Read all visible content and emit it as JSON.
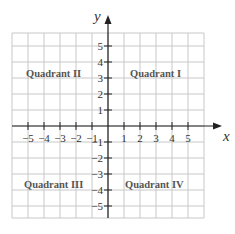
{
  "diagram": {
    "type": "coordinate-plane",
    "axes": {
      "x_label": "x",
      "y_label": "y"
    },
    "x_ticks": [
      "−5",
      "−4",
      "−3",
      "−2",
      "−1",
      "1",
      "2",
      "3",
      "4",
      "5"
    ],
    "y_ticks_pos": [
      "5",
      "4",
      "3",
      "2",
      "1"
    ],
    "y_ticks_neg": [
      "−1",
      "−2",
      "−3",
      "−4",
      "−5"
    ],
    "quadrants": {
      "q1": "Quadrant I",
      "q2": "Quadrant II",
      "q3": "Quadrant III",
      "q4": "Quadrant IV"
    },
    "colors": {
      "grid": "#c8c8c8",
      "axis": "#222222",
      "label": "#555555"
    }
  }
}
